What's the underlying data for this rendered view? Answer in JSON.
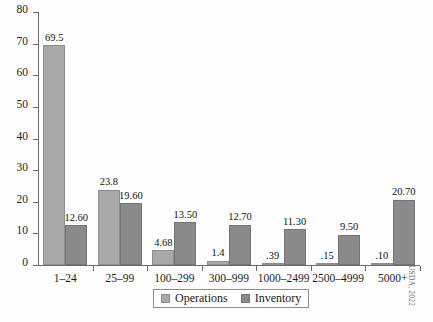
{
  "chart_data": {
    "type": "bar",
    "title": "",
    "subtitle": "",
    "xlabel": "",
    "ylabel": "",
    "ylim": [
      0,
      80
    ],
    "yticks": [
      0,
      10,
      20,
      30,
      40,
      50,
      60,
      70,
      80
    ],
    "ytick_labels": [
      "0",
      "10",
      "20",
      "30",
      "40",
      "50",
      "60",
      "70",
      "80"
    ],
    "grid": false,
    "legend_position": "bottom-center",
    "categories": [
      "1–24",
      "25–99",
      "100–299",
      "300–999",
      "1000–2499",
      "2500–4999",
      "5000+"
    ],
    "series": [
      {
        "name": "Operations",
        "color": "#a9a9a9",
        "values": [
          69.5,
          23.8,
          4.68,
          1.4,
          0.39,
          0.15,
          0.1
        ],
        "value_labels": [
          "69.5",
          "23.8",
          "4.68",
          "1.4",
          ".39",
          ".15",
          ".10"
        ]
      },
      {
        "name": "Inventory",
        "color": "#8a8a8a",
        "values": [
          12.6,
          19.6,
          13.5,
          12.7,
          11.3,
          9.5,
          20.7
        ],
        "value_labels": [
          "12.60",
          "19.60",
          "13.50",
          "12.70",
          "11.30",
          "9.50",
          "20.70"
        ]
      }
    ],
    "annotations": {
      "credit": "USDA, 2022"
    }
  },
  "legend": {
    "items": [
      {
        "label": "Operations",
        "swatch": "operations-swatch"
      },
      {
        "label": "Inventory",
        "swatch": "inventory-swatch"
      }
    ]
  },
  "caption": {
    "text": ""
  }
}
